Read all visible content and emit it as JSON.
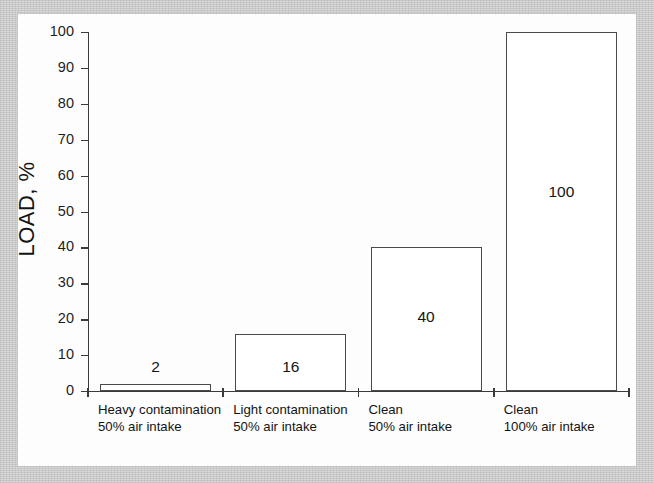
{
  "figure": {
    "background_color": "#d9d9d9",
    "page_color": "#fdfdfd",
    "axis_color": "#3a3a3a",
    "bar_edge_color": "#4a4a4a",
    "bar_fill_color": "#ffffff"
  },
  "chart_data": {
    "type": "bar",
    "title": "",
    "xlabel": "",
    "ylabel": "LOAD, %",
    "ylim": [
      0,
      100
    ],
    "yticks": [
      0,
      10,
      20,
      30,
      40,
      50,
      60,
      70,
      80,
      90,
      100
    ],
    "ytick_labels": [
      "0",
      "10",
      "20",
      "30",
      "40",
      "50",
      "60",
      "70",
      "80",
      "90",
      "100"
    ],
    "grid": false,
    "legend": null,
    "categories": [
      "Heavy contamination 50% air intake",
      "Light contamination 50% air intake",
      "Clean 50% air intake",
      "Clean 100% air intake"
    ],
    "category_lines": [
      {
        "line1": "Heavy contamination",
        "line2": "50% air intake"
      },
      {
        "line1": "Light contamination",
        "line2": "50% air intake"
      },
      {
        "line1": "Clean",
        "line2": "50% air intake"
      },
      {
        "line1": "Clean",
        "line2": "100% air intake"
      }
    ],
    "values": [
      2,
      16,
      40,
      100
    ],
    "value_labels": [
      "2",
      "16",
      "40",
      "100"
    ],
    "value_label_placement": [
      "above",
      "inside",
      "inside",
      "inside"
    ]
  }
}
